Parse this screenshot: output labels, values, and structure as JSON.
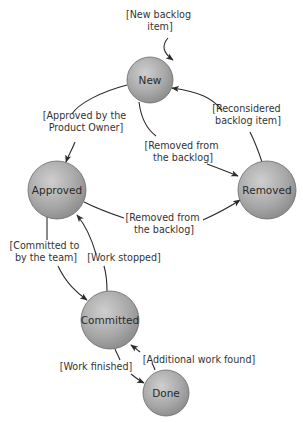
{
  "diagram": {
    "type": "state-diagram",
    "colors": {
      "node_fill_light": "#c9c9c9",
      "node_fill_dark": "#8f8f8f",
      "node_stroke": "#6a6a6a",
      "edge": "#2a2a2a",
      "text": "#333333"
    },
    "nodes": [
      {
        "id": "new",
        "label": "New"
      },
      {
        "id": "approved",
        "label": "Approved"
      },
      {
        "id": "removed",
        "label": "Removed"
      },
      {
        "id": "committed",
        "label": "Committed"
      },
      {
        "id": "done",
        "label": "Done"
      }
    ],
    "edges": [
      {
        "id": "start-new",
        "from": "",
        "to": "new",
        "label_lines": [
          "[New backlog",
          "item]"
        ]
      },
      {
        "id": "new-approved",
        "from": "new",
        "to": "approved",
        "label_lines": [
          "[Approved by the",
          "Product Owner]"
        ]
      },
      {
        "id": "new-removed",
        "from": "new",
        "to": "removed",
        "label_lines": [
          "[Removed from",
          "the backlog]"
        ]
      },
      {
        "id": "removed-new",
        "from": "removed",
        "to": "new",
        "label_lines": [
          "[Reconsidered",
          "backlog item]"
        ]
      },
      {
        "id": "approved-removed",
        "from": "approved",
        "to": "removed",
        "label_lines": [
          "[Removed from",
          "the backlog]"
        ]
      },
      {
        "id": "approved-committed",
        "from": "approved",
        "to": "committed",
        "label_lines": [
          "[Committed to",
          "by the team]"
        ]
      },
      {
        "id": "committed-approved",
        "from": "committed",
        "to": "approved",
        "label_lines": [
          "[Work stopped]"
        ]
      },
      {
        "id": "committed-done",
        "from": "committed",
        "to": "done",
        "label_lines": [
          "[Work finished]"
        ]
      },
      {
        "id": "done-committed",
        "from": "done",
        "to": "committed",
        "label_lines": [
          "[Additional work found]"
        ]
      }
    ]
  }
}
